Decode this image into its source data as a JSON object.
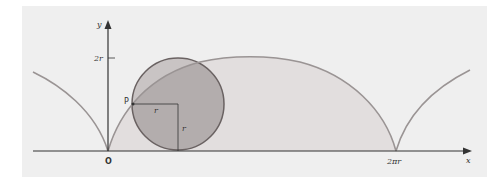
{
  "diagram": {
    "colors": {
      "panel": "#efefef",
      "arch_fill": "#e2dede",
      "circle_fill": "#c9c4c4",
      "circle_overlap_fill": "#b3adad",
      "curve": "#9a9494",
      "circle_stroke": "#6a6262",
      "axis": "#333333"
    },
    "labels": {
      "y_axis": "y",
      "x_axis": "x",
      "origin": "O",
      "y_tick": "2r",
      "x_tick": "2πr",
      "point": "P",
      "radius_horizontal": "r",
      "radius_vertical": "r"
    }
  }
}
